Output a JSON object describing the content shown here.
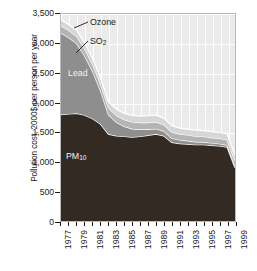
{
  "chart_data": {
    "type": "area",
    "stacked": true,
    "title": "",
    "xlabel": "",
    "ylabel": "Pollution cost, 2000$ per person per year",
    "ylim": [
      0,
      3500
    ],
    "ytick_values": [
      0,
      500,
      1000,
      1500,
      2000,
      2500,
      3000,
      3500
    ],
    "ytick_labels": [
      "0",
      "500",
      "1,000",
      "1,500",
      "2,000",
      "2,500",
      "3,000",
      "3,500"
    ],
    "xlim": [
      1977,
      1999
    ],
    "x": [
      1977,
      1978,
      1979,
      1980,
      1981,
      1982,
      1983,
      1984,
      1985,
      1986,
      1987,
      1988,
      1989,
      1990,
      1991,
      1992,
      1993,
      1994,
      1995,
      1996,
      1997,
      1998,
      1999
    ],
    "xtick_values": [
      1977,
      1978,
      1979,
      1980,
      1981,
      1982,
      1983,
      1984,
      1985,
      1986,
      1987,
      1988,
      1989,
      1990,
      1991,
      1992,
      1993,
      1994,
      1995,
      1996,
      1997,
      1998,
      1999
    ],
    "xtick_labels": [
      "1977",
      "",
      "1979",
      "",
      "1981",
      "",
      "1983",
      "",
      "1985",
      "",
      "1987",
      "",
      "1989",
      "",
      "1991",
      "",
      "1993",
      "",
      "1995",
      "",
      "1997",
      "",
      "1999"
    ],
    "grid": true,
    "legend_position": "inline-annotations",
    "series": [
      {
        "name": "PM10",
        "label_html": "PM<sub>10</sub>",
        "color": "#332b23",
        "values": [
          1800,
          1810,
          1820,
          1790,
          1730,
          1640,
          1470,
          1440,
          1430,
          1420,
          1430,
          1450,
          1470,
          1440,
          1330,
          1310,
          1300,
          1290,
          1290,
          1280,
          1270,
          1250,
          900
        ]
      },
      {
        "name": "Lead",
        "label_html": "Lead",
        "color": "#8e8e8e",
        "values": [
          1380,
          1290,
          1180,
          1000,
          800,
          560,
          330,
          230,
          170,
          140,
          120,
          100,
          90,
          80,
          70,
          60,
          55,
          50,
          45,
          40,
          38,
          35,
          30
        ]
      },
      {
        "name": "SO2",
        "label_html": "SO<sub>2</sub>",
        "color": "#b4b4b4",
        "values": [
          120,
          120,
          120,
          115,
          115,
          115,
          115,
          115,
          115,
          115,
          115,
          115,
          115,
          110,
          105,
          100,
          100,
          95,
          95,
          90,
          90,
          90,
          85
        ]
      },
      {
        "name": "Ozone",
        "label_html": "Ozone",
        "color": "#d6d6d6",
        "values": [
          100,
          100,
          100,
          100,
          100,
          100,
          100,
          105,
          105,
          110,
          110,
          115,
          115,
          110,
          105,
          100,
          100,
          100,
          100,
          100,
          100,
          100,
          95
        ]
      }
    ],
    "annotations": [
      {
        "name": "ozone-label",
        "text": "Ozone",
        "style": "leader-line"
      },
      {
        "name": "so2-label",
        "text": "SO2",
        "style": "leader-line"
      },
      {
        "name": "lead-label",
        "text": "Lead",
        "style": "inline-white"
      },
      {
        "name": "pm10-label",
        "text": "PM10",
        "style": "inline-white"
      }
    ],
    "plot_bg": "#ebebeb",
    "grid_color": "#ffffff",
    "axis_color": "#1a1a1a"
  },
  "axis": {
    "y_title": "Pollution cost, 2000$ per person per year"
  },
  "labels": {
    "ozone": "Ozone",
    "so2_main": "SO",
    "so2_sub": "2",
    "lead": "Lead",
    "pm_main": "PM",
    "pm_sub": "10"
  }
}
